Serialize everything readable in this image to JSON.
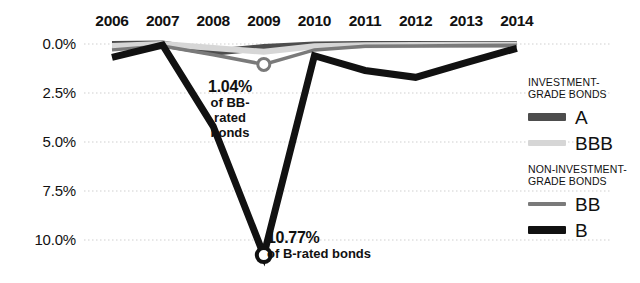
{
  "chart_data": {
    "type": "line",
    "title": "",
    "xlabel": "",
    "ylabel": "",
    "categories": [
      "2006",
      "2007",
      "2008",
      "2009",
      "2010",
      "2011",
      "2012",
      "2013",
      "2014"
    ],
    "ylim": [
      0.0,
      11.0
    ],
    "y_inverted": true,
    "yticks": [
      "0.0%",
      "2.5%",
      "5.0%",
      "7.5%",
      "10.0%"
    ],
    "ytick_values": [
      0.0,
      2.5,
      5.0,
      7.5,
      10.0
    ],
    "grid": true,
    "legend_position": "right",
    "series": [
      {
        "name": "A",
        "group": "investment-grade",
        "color": "#4d4d4d",
        "width": 7,
        "values": [
          0.02,
          0.0,
          0.42,
          0.18,
          0.05,
          0.03,
          0.03,
          0.02,
          0.02
        ]
      },
      {
        "name": "BBB",
        "group": "investment-grade",
        "color": "#d6d6d6",
        "width": 6,
        "values": [
          0.1,
          0.0,
          0.2,
          0.4,
          0.12,
          0.06,
          0.05,
          0.04,
          0.04
        ]
      },
      {
        "name": "BB",
        "group": "non-investment-grade",
        "color": "#7a7a7a",
        "width": 3.5,
        "values": [
          0.3,
          0.1,
          0.55,
          1.04,
          0.3,
          0.12,
          0.1,
          0.08,
          0.06
        ]
      },
      {
        "name": "B",
        "group": "non-investment-grade",
        "color": "#111111",
        "width": 7,
        "values": [
          0.68,
          0.05,
          4.2,
          10.77,
          0.6,
          1.35,
          1.7,
          0.95,
          0.22
        ]
      }
    ],
    "annotations": [
      {
        "id": "bb-2009",
        "series": "BB",
        "year": "2009",
        "value": 1.04,
        "value_label": "1.04%",
        "text": "of BB-rated bonds",
        "text_lines": [
          "of BB-",
          "rated",
          "bonds"
        ],
        "marker": "circle"
      },
      {
        "id": "b-2009",
        "series": "B",
        "year": "2009",
        "value": 10.77,
        "value_label": "10.77%",
        "text": "of B-rated bonds",
        "text_lines": [
          "of B-rated bonds"
        ],
        "marker": "circle"
      }
    ]
  },
  "legend": {
    "groups": [
      {
        "heading_lines": [
          "INVESTMENT-",
          "GRADE BONDS"
        ],
        "entries": [
          {
            "label": "A",
            "color": "#4d4d4d",
            "thickness": 8
          },
          {
            "label": "BBB",
            "color": "#d6d6d6",
            "thickness": 6
          }
        ]
      },
      {
        "heading_lines": [
          "NON-INVESTMENT-",
          "GRADE BONDS"
        ],
        "entries": [
          {
            "label": "BB",
            "color": "#7a7a7a",
            "thickness": 4
          },
          {
            "label": "B",
            "color": "#111111",
            "thickness": 8
          }
        ]
      }
    ]
  },
  "colors": {
    "grid": "#cfcfcf",
    "text": "#111111",
    "background": "#ffffff"
  }
}
